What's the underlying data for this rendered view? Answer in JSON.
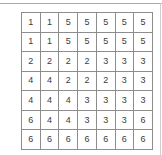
{
  "grid": {
    "rows": 7,
    "cols": 7,
    "border_color": "#8d8d8d",
    "text_color": "#3b3b3b",
    "cell_background": "#ffffff",
    "values": [
      [
        1,
        1,
        5,
        5,
        5,
        5,
        5
      ],
      [
        1,
        1,
        5,
        5,
        5,
        5,
        5
      ],
      [
        2,
        2,
        2,
        2,
        3,
        3,
        3
      ],
      [
        4,
        4,
        2,
        2,
        2,
        3,
        3
      ],
      [
        4,
        4,
        4,
        3,
        3,
        3,
        3
      ],
      [
        6,
        4,
        4,
        3,
        3,
        3,
        6
      ],
      [
        6,
        6,
        6,
        6,
        6,
        6,
        6
      ]
    ]
  },
  "decorations": {
    "top_rule_color": "#a8a8a8",
    "right_rule_color": "#cfcfcf"
  },
  "page": {
    "background": "#ffffff"
  }
}
